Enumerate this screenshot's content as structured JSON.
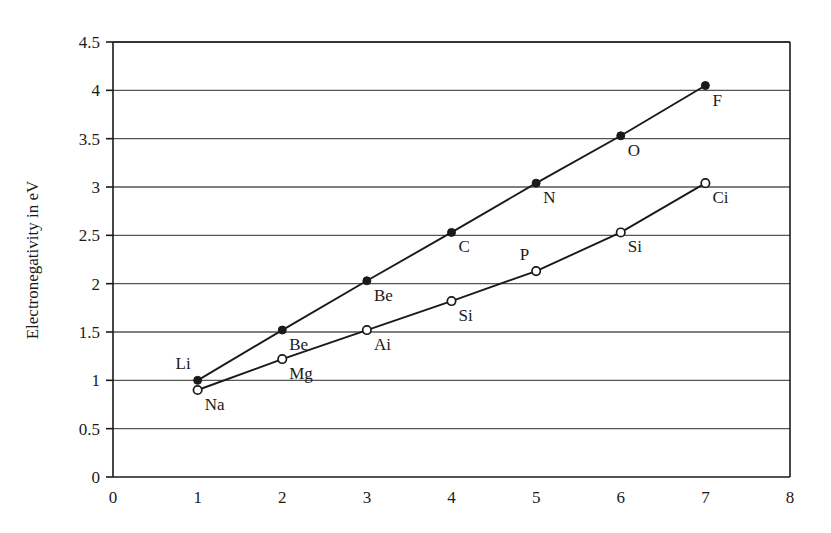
{
  "chart_data": {
    "type": "line",
    "title": "",
    "subtitle": "",
    "xlabel": "",
    "ylabel": "Electronegativity in eV",
    "xlim": [
      0,
      8
    ],
    "ylim": [
      0,
      4.5
    ],
    "xticks": [
      "0",
      "1",
      "2",
      "3",
      "4",
      "5",
      "6",
      "7",
      "8"
    ],
    "xtick_values": [
      0,
      1,
      2,
      3,
      4,
      5,
      6,
      7,
      8
    ],
    "yticks": [
      "0",
      "0.5",
      "1",
      "1.5",
      "2",
      "2.5",
      "3",
      "3.5",
      "4",
      "4.5"
    ],
    "ytick_values": [
      0,
      0.5,
      1,
      1.5,
      2,
      2.5,
      3,
      3.5,
      4,
      4.5
    ],
    "grid": "horizontal",
    "legend": "none",
    "x": [
      1,
      2,
      3,
      4,
      5,
      6,
      7
    ],
    "series": [
      {
        "name": "period-2",
        "marker": "filled-circle",
        "values": [
          1.0,
          1.52,
          2.03,
          2.53,
          3.04,
          3.53,
          4.05
        ],
        "point_labels": [
          "Li",
          "Be",
          "Be",
          "C",
          "N",
          "O",
          "F"
        ],
        "label_positions": [
          "above-left",
          "below-right",
          "below-right",
          "below-right",
          "below-right",
          "below-right",
          "below-right"
        ]
      },
      {
        "name": "period-3",
        "marker": "open-circle",
        "values": [
          0.9,
          1.22,
          1.52,
          1.82,
          2.13,
          2.53,
          3.04
        ],
        "point_labels": [
          "Na",
          "Mg",
          "Ai",
          "Si",
          "P",
          "Si",
          "Ci"
        ],
        "label_positions": [
          "below-right",
          "below-right",
          "below-right",
          "below-right",
          "above-left",
          "below-right",
          "below-right"
        ]
      }
    ],
    "colors": {
      "line": "#1a1a1a",
      "grid": "#555555",
      "axis": "#1a1a1a",
      "marker_fill_series1": "#1a1a1a",
      "marker_fill_series2": "#ffffff",
      "background": "#ffffff"
    }
  }
}
